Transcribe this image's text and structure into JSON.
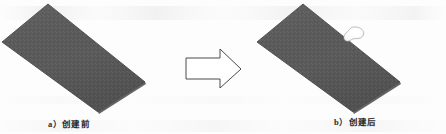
{
  "figure": {
    "kind": "engineering-illustration",
    "background_color": "#fdfdfd",
    "width": 446,
    "height": 134,
    "description_left": "dark gray rectangular plate shown in isometric view, no pocket",
    "description_right": "same dark gray rectangular plate with a small irregular white pocket cut into its upper surface"
  },
  "panels": [
    {
      "id": "before",
      "caption": "a）创建前",
      "caption_prefix": "a）",
      "caption_text": "创建前",
      "shape_name": "plate-solid",
      "has_pocket": false
    },
    {
      "id": "after",
      "caption": "b）创建后",
      "caption_prefix": "b）",
      "caption_text": "创建后",
      "shape_name": "plate-with-pocket",
      "has_pocket": true
    }
  ],
  "arrow": {
    "name": "transformation-arrow",
    "direction": "right",
    "fill_color": "#ffffff",
    "stroke_color": "#4a4a4a"
  },
  "colors": {
    "plate_fill": "#5b5b5b",
    "plate_fill_shade": "#545454",
    "plate_edge": "#4c4c4c",
    "pocket_fill": "#fbfbfb",
    "pocket_edge": "#8a8a8a",
    "caption_text": "#2b2b2b",
    "paper": "#fdfdfd"
  },
  "geometry": {
    "plate_left_polygon": "48,4 145,82 98,112 2,42",
    "plate_right_polygon": "303,4 400,82 353,112 257,42",
    "arrow_polygon": "186,58 220,58 220,50 240,69 220,88 220,80 186,80",
    "pocket_center": [
      354,
      35
    ]
  }
}
